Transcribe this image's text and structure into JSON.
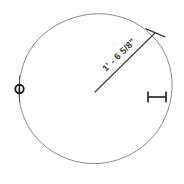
{
  "drawing": {
    "title": "Circle radius dimension detail",
    "background_color": "#ffffff",
    "line_color": "#7d7d7d",
    "dimension_color": "#3a3a3a",
    "marker_color": "#1f1f1f",
    "circle": {
      "label": "circle-outline",
      "center_x": 95,
      "center_y": 91,
      "radius": 77,
      "stroke_width": 0.9
    },
    "radius_dimension": {
      "label": "radius-dimension-line",
      "value_text": "1' - 6 5/8\"",
      "feet": "1'",
      "inches": "6 5/8\"",
      "separator": "-",
      "start_x": 95,
      "start_y": 92,
      "end_x": 155,
      "end_y": 33,
      "angle_deg": -44.5,
      "stroke_width": 1.4
    },
    "end_tick": {
      "label": "dimension-end-tick",
      "x": 155,
      "y": 33,
      "length": 18,
      "angle_deg": 40,
      "stroke_width": 1.3
    },
    "node_marker": {
      "label": "node-point-marker",
      "x": 19,
      "y": 89,
      "radius": 4.2,
      "stem_top_y": 76,
      "stem_bottom_y": 102,
      "stroke_width": 1.2
    },
    "ibeam_marker": {
      "label": "ibeam-dimension-marker",
      "x": 147,
      "y": 97,
      "width": 20,
      "cap_height": 11,
      "stroke_width": 1.5
    }
  }
}
